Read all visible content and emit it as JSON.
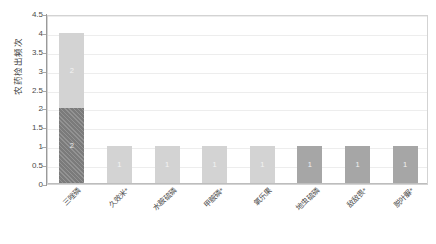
{
  "chart_data": {
    "type": "bar",
    "title": "",
    "subtitle": "",
    "xlabel": "",
    "ylabel": "农药检出频次",
    "ylim": [
      0,
      4.5
    ],
    "ytick_labels": [
      "0",
      "0.5",
      "1",
      "1.5",
      "2",
      "2.5",
      "3",
      "3.5",
      "4",
      "4.5"
    ],
    "ytick_values": [
      0,
      0.5,
      1,
      1.5,
      2,
      2.5,
      3,
      3.5,
      4,
      4.5
    ],
    "grid": true,
    "grid_axis": "y",
    "legend": false,
    "legend_position": "none",
    "stacked": true,
    "categories": [
      "三唑磷",
      "久效米*",
      "水胺硫磷",
      "甲胺磷*",
      "氧乐果",
      "地虫硫磷",
      "敌敌畏*",
      "脱叶脲*"
    ],
    "series": [
      {
        "name": "segment-1",
        "color": "#7b7b7b",
        "pattern": "diagonal-hatch",
        "values": [
          2,
          0,
          0,
          0,
          0,
          0,
          0,
          0
        ],
        "labels": [
          "2",
          "",
          "",
          "",
          "",
          "",
          "",
          ""
        ]
      },
      {
        "name": "segment-2",
        "color": "#d3d3d3",
        "pattern": "solid",
        "values": [
          2,
          1,
          1,
          1,
          1,
          0,
          0,
          0
        ],
        "labels": [
          "2",
          "1",
          "1",
          "1",
          "1",
          "",
          "",
          ""
        ]
      },
      {
        "name": "segment-3",
        "color": "#a6a6a6",
        "pattern": "solid",
        "values": [
          0,
          0,
          0,
          0,
          0,
          1,
          1,
          1
        ],
        "labels": [
          "",
          "",
          "",
          "",
          "",
          "1",
          "1",
          "1"
        ]
      }
    ],
    "totals": [
      4,
      1,
      1,
      1,
      1,
      1,
      1,
      1
    ],
    "bar_styles": [
      "stacked-dark-light",
      "light",
      "light",
      "light",
      "light",
      "mid",
      "mid",
      "mid"
    ]
  },
  "colors": {
    "plot_background": "#ffffff",
    "page_background": "#ffffff",
    "gridline": "#ededed",
    "axis": "#9a9a9a",
    "border": "#d3d3d3",
    "bar_light": "#d3d3d3",
    "bar_mid": "#a6a6a6",
    "bar_dark": "#7b7b7b",
    "text": "#4a4a4a"
  }
}
